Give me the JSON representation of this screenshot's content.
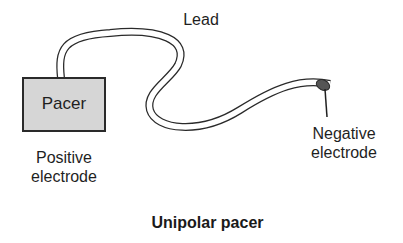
{
  "diagram": {
    "title": "Unipolar pacer",
    "pacer": {
      "label": "Pacer",
      "fill": "#d6d6d6"
    },
    "lead": {
      "label": "Lead"
    },
    "positive_electrode": {
      "label_line1": "Positive",
      "label_line2": "electrode"
    },
    "negative_electrode": {
      "label_line1": "Negative",
      "label_line2": "electrode",
      "fill": "#555555"
    }
  }
}
